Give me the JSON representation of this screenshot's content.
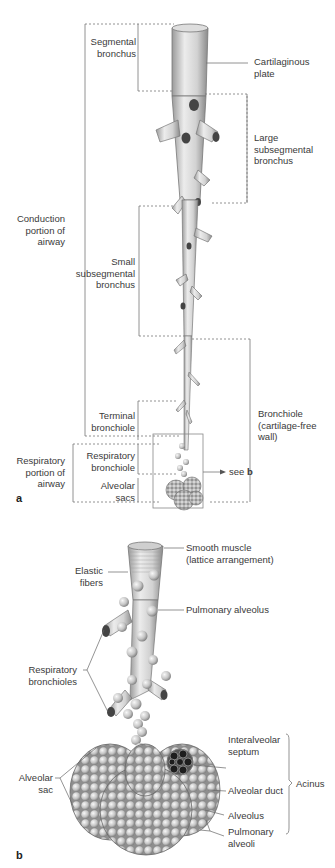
{
  "panel_a": {
    "letter": "a",
    "labels": {
      "segmental_bronchus": "Segmental\nbronchus",
      "cartilaginous_plate": "Cartilaginous\nplate",
      "large_subsegmental_bronchus": "Large\nsubsegmental\nbronchus",
      "conduction_portion": "Conduction\nportion of\nairway",
      "small_subsegmental_bronchus": "Small\nsubsegmental\nbronchus",
      "bronchiole": "Bronchiole\n(cartilage-free\nwall)",
      "terminal_bronchiole": "Terminal\nbronchiole",
      "respiratory_portion": "Respiratory\nportion of\nairway",
      "respiratory_bronchiole": "Respiratory\nbronchiole",
      "alveolar_sacs": "Alveolar\nsacs",
      "see_prefix": "see ",
      "see_ref": "b"
    }
  },
  "panel_b": {
    "letter": "b",
    "labels": {
      "smooth_muscle": "Smooth muscle\n(lattice arrangement)",
      "elastic_fibers": "Elastic\nfibers",
      "pulmonary_alveolus": "Pulmonary alveolus",
      "respiratory_bronchioles": "Respiratory\nbronchioles",
      "interalveolar_septum": "Interalveolar\nseptum",
      "alveolar_sac": "Alveolar\nsac",
      "alveolar_duct": "Alveolar duct",
      "acinus": "Acinus",
      "alveolus": "Alveolus",
      "pulmonary_alveoli": "Pulmonary\nalveoli"
    }
  },
  "colors": {
    "line": "#6a6a6a",
    "tissue_light": "#e6e6e6",
    "tissue_mid": "#bdbdbd",
    "tissue_dark": "#7a7a7a"
  }
}
